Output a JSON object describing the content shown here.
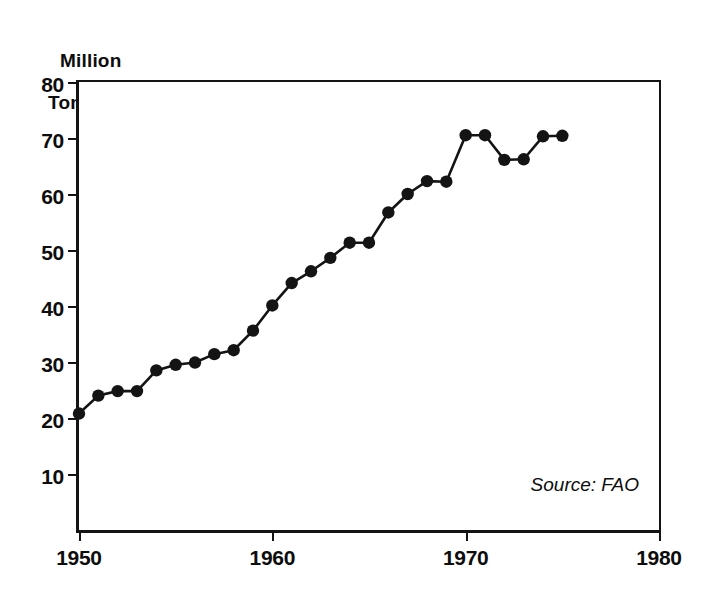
{
  "chart_data": {
    "type": "line",
    "title": "",
    "ylabel_line1": "Million",
    "ylabel_line2": "Tons",
    "xlabel": "",
    "source_note": "Source: FAO",
    "xlim": [
      1950,
      1980
    ],
    "ylim": [
      0,
      80
    ],
    "yticks": [
      10,
      20,
      30,
      40,
      50,
      60,
      70,
      80
    ],
    "ytick_labels": [
      "10",
      "20",
      "30",
      "40",
      "50",
      "60",
      "70",
      "80"
    ],
    "xticks": [
      1950,
      1960,
      1970,
      1980
    ],
    "xtick_labels": [
      "1950",
      "1960",
      "1970",
      "1980"
    ],
    "grid": false,
    "legend": false,
    "marker": "filled-circle",
    "line_color": "#141414",
    "marker_color": "#141414",
    "x": [
      1950,
      1951,
      1952,
      1953,
      1954,
      1955,
      1956,
      1957,
      1958,
      1959,
      1960,
      1961,
      1962,
      1963,
      1964,
      1965,
      1966,
      1967,
      1968,
      1969,
      1970,
      1971,
      1972,
      1973,
      1974,
      1975
    ],
    "values": [
      20.8,
      24.0,
      24.8,
      24.8,
      28.5,
      29.5,
      29.9,
      31.4,
      32.1,
      35.6,
      40.1,
      44.1,
      46.2,
      48.6,
      51.3,
      51.3,
      56.7,
      60.0,
      62.3,
      62.2,
      70.5,
      70.5,
      66.1,
      66.2,
      70.3,
      70.4
    ],
    "series": [
      {
        "name": "World fish catch",
        "values": [
          20.8,
          24.0,
          24.8,
          24.8,
          28.5,
          29.5,
          29.9,
          31.4,
          32.1,
          35.6,
          40.1,
          44.1,
          46.2,
          48.6,
          51.3,
          51.3,
          56.7,
          60.0,
          62.3,
          62.2,
          70.5,
          70.5,
          66.1,
          66.2,
          70.3,
          70.4
        ]
      }
    ]
  }
}
